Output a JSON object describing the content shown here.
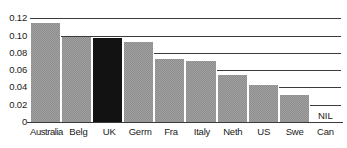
{
  "chart_data": {
    "type": "bar",
    "title": "",
    "subtitle": "",
    "xlabel": "",
    "ylabel": "",
    "ylim": [
      0,
      0.125
    ],
    "grid": true,
    "legend": "none",
    "categories": [
      "Australia",
      "Belg",
      "UK",
      "Germ",
      "Fra",
      "Italy",
      "Neth",
      "US",
      "Swe",
      "Can"
    ],
    "values": [
      0.115,
      0.098,
      0.097,
      0.093,
      0.073,
      0.071,
      0.054,
      0.043,
      0.031,
      0
    ],
    "ytick_labels": [
      "0.12",
      "0.10",
      "0.08",
      "0.06",
      "0.04",
      "0.02",
      "0"
    ],
    "ytick_values": [
      0.12,
      0.1,
      0.08,
      0.06,
      0.04,
      0.02,
      0
    ],
    "annotations": [
      {
        "category": "Can",
        "text": "NIL"
      }
    ],
    "highlight_category": "UK",
    "colors": {
      "bar": "#8c8c8c",
      "highlight_bar": "#121212",
      "gridline": "#3b3b3b",
      "axis": "#3b3b3b",
      "text": "#1a1a1a",
      "background": "#ffffff"
    }
  },
  "yticks": [
    {
      "label": "0.12"
    },
    {
      "label": "0.10"
    },
    {
      "label": "0.08"
    },
    {
      "label": "0.06"
    },
    {
      "label": "0.04"
    },
    {
      "label": "0.02"
    },
    {
      "label": "0"
    }
  ],
  "bars": [
    {
      "label": "Australia",
      "value": 0.115
    },
    {
      "label": "Belg",
      "value": 0.098
    },
    {
      "label": "UK",
      "value": 0.097
    },
    {
      "label": "Germ",
      "value": 0.093
    },
    {
      "label": "Fra",
      "value": 0.073
    },
    {
      "label": "Italy",
      "value": 0.071
    },
    {
      "label": "Neth",
      "value": 0.054
    },
    {
      "label": "US",
      "value": 0.043
    },
    {
      "label": "Swe",
      "value": 0.031
    },
    {
      "label": "Can",
      "value": 0,
      "note": "NIL"
    }
  ]
}
